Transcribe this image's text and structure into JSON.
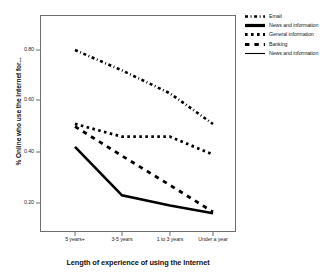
{
  "chart_data": {
    "type": "line",
    "title": "",
    "xlabel": "Length of experience of using the Internet",
    "ylabel": "% Online who use the Internet for...",
    "categories": [
      "5 years+",
      "3-5 years",
      "1 to 3 years",
      "Under a year"
    ],
    "ylim": [
      0.08,
      0.9
    ],
    "yticks": [
      "0.20",
      "0.40",
      "0.60",
      "0.80"
    ],
    "ytick_values": [
      0.2,
      0.4,
      0.6,
      0.8
    ],
    "grid": false,
    "legend_position": "right",
    "series": [
      {
        "name": "Email",
        "style": "dash-dot",
        "values": [
          0.8,
          0.72,
          0.63,
          0.51
        ]
      },
      {
        "name": "General information",
        "style": "dotted",
        "values": [
          0.51,
          0.46,
          0.46,
          0.39
        ]
      },
      {
        "name": "Banking",
        "style": "dashed",
        "values": [
          0.5,
          0.385,
          0.27,
          0.165
        ]
      },
      {
        "name": "News and information",
        "style": "solid",
        "values": [
          0.42,
          0.23,
          0.19,
          0.16
        ]
      }
    ]
  },
  "legend": {
    "items": [
      {
        "label": "Email",
        "style": "dash-dot"
      },
      {
        "label": "News and information",
        "style": "thick-solid"
      },
      {
        "label": "General information",
        "style": "dotted"
      },
      {
        "label": "Banking",
        "style": "dashed"
      },
      {
        "label": "News and information",
        "style": "solid"
      }
    ]
  },
  "axes": {
    "y_title": "% Online who use the Internet for...",
    "x_title": "Length of experience of using the Internet",
    "y_ticks": [
      "0.80",
      "0.60",
      "0.40",
      "0.20"
    ],
    "x_ticks": [
      "5 years+",
      "3-5 years",
      "1 to 3 years",
      "Under a year"
    ]
  },
  "colors": {
    "ink": "#000000",
    "frame": "#6d6d6d",
    "background": "#ffffff"
  }
}
